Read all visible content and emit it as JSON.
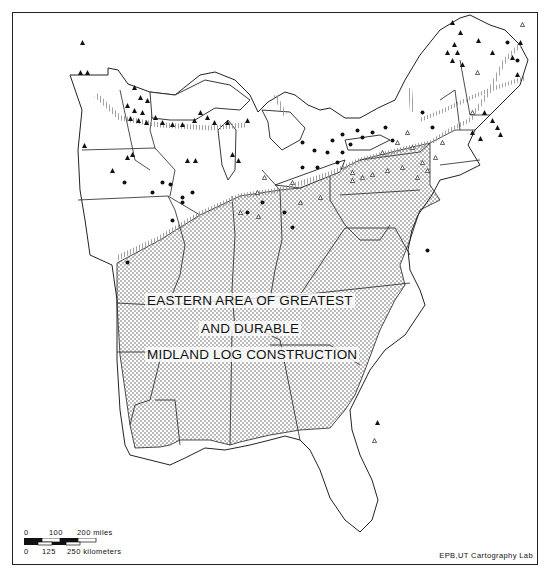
{
  "map": {
    "title_lines": [
      "EASTERN AREA OF GREATEST",
      "AND DURABLE",
      "MIDLAND LOG CONSTRUCTION"
    ],
    "shaded_region": "Eastern area of greatest and durable Midland log construction",
    "symbol_types": [
      "filled-triangle",
      "filled-dot",
      "open-triangle"
    ],
    "colors": {
      "ink": "#111111",
      "stipple": "#555555",
      "hatch": "#9a9a9a",
      "background": "#ffffff"
    }
  },
  "scale": {
    "miles_labels": [
      "0",
      "100",
      "200 miles"
    ],
    "km_labels": [
      "0",
      "125",
      "250 kilometers"
    ]
  },
  "credit": "EPB,UT Cartography Lab"
}
